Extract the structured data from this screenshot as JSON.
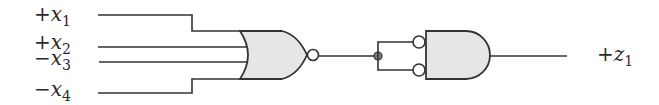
{
  "diagram": {
    "type": "logic-circuit",
    "inputs": [
      {
        "sign": "+",
        "var": "x",
        "sub": "1"
      },
      {
        "sign": "+",
        "var": "x",
        "sub": "2"
      },
      {
        "sign": "−",
        "var": "x",
        "sub": "3"
      },
      {
        "sign": "−",
        "var": "x",
        "sub": "4"
      }
    ],
    "gates": [
      {
        "id": "g1",
        "kind": "NOR",
        "inputs": [
          "+x1",
          "+x2",
          "-x3",
          "-x4"
        ],
        "output_inverted": true
      },
      {
        "id": "g2",
        "kind": "AND",
        "inputs_inverted": [
          true,
          true
        ],
        "inputs": [
          "g1",
          "g1"
        ]
      }
    ],
    "output": {
      "sign": "+",
      "var": "z",
      "sub": "1"
    },
    "colors": {
      "line": "#333333",
      "gate_fill": "#e6e6e6",
      "junction_fill": "#7a7a7a"
    }
  }
}
